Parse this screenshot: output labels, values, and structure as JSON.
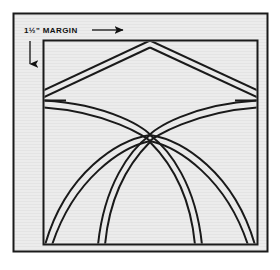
{
  "figure": {
    "annotation": {
      "margin_label": "1½\" MARGIN",
      "horizontal_arrow_icon": "arrow-right-icon",
      "vertical_arrow_icon": "arrow-down-icon"
    },
    "colors": {
      "page_background": "#ffffff",
      "panel_fill": "#ebebeb",
      "panel_border": "#1a1a1a",
      "line_stroke": "#1a1a1a",
      "inner_fill": "#ebebeb"
    },
    "geometry": {
      "outer_frame": {
        "x": 13,
        "y": 13,
        "width": 255,
        "height": 239
      },
      "inner_square": {
        "x": 43,
        "y": 40,
        "width": 215,
        "height": 205
      },
      "apex_point": {
        "x": 150,
        "y": 40
      },
      "center_point": {
        "x": 150,
        "y": 135
      },
      "triangle_left_corner": {
        "x": 43,
        "y": 93
      },
      "triangle_right_corner": {
        "x": 258,
        "y": 93
      },
      "band_width": 5,
      "bottom_leg_x": [
        44,
        98,
        200,
        256
      ]
    },
    "shapes": [
      {
        "name": "outer-frame",
        "type": "rect"
      },
      {
        "name": "inner-square",
        "type": "rect"
      },
      {
        "name": "peak-band-left",
        "type": "band"
      },
      {
        "name": "peak-band-right",
        "type": "band"
      },
      {
        "name": "arch-band-left-outer",
        "type": "arc"
      },
      {
        "name": "arch-band-right-outer",
        "type": "arc"
      },
      {
        "name": "arch-band-left-inner",
        "type": "arc"
      },
      {
        "name": "arch-band-right-inner",
        "type": "arc"
      },
      {
        "name": "horizontal-divider-left",
        "type": "line"
      },
      {
        "name": "horizontal-divider-right",
        "type": "line"
      }
    ]
  }
}
